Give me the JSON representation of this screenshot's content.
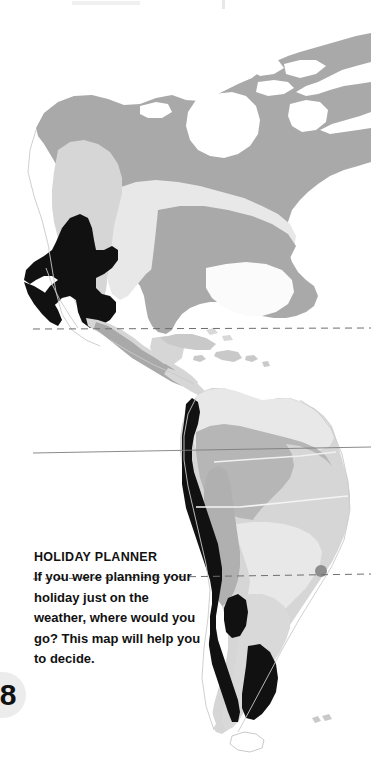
{
  "page": {
    "kind": "printed-atlas-page",
    "number": "8",
    "background_color": "#ffffff"
  },
  "map": {
    "name": "climate-map-of-the-americas",
    "region": "The Americas",
    "sea_color": "#ffffff",
    "latitude_lines": [
      {
        "name": "tropic-of-cancer",
        "style": "dashed",
        "color": "#6e6e6e"
      },
      {
        "name": "equator",
        "style": "solid",
        "color": "#7a7a7a"
      },
      {
        "name": "tropic-of-capricorn",
        "style": "dashed",
        "color": "#6e6e6e"
      }
    ],
    "climate_zone_colors": {
      "very_hot_black": "#111111",
      "mid_gray": "#a9a9a9",
      "soft_gray": "#c2c2c2",
      "light_gray": "#d6d6d6",
      "pale_gray": "#e7e7e7",
      "white": "#fbfbfb"
    },
    "coastline_color": "#c9c9c9"
  },
  "holiday_planner": {
    "title": "HOLIDAY PLANNER",
    "body": "If you were planning your holiday just on the weather, where would you go? This map will help you to decide."
  }
}
